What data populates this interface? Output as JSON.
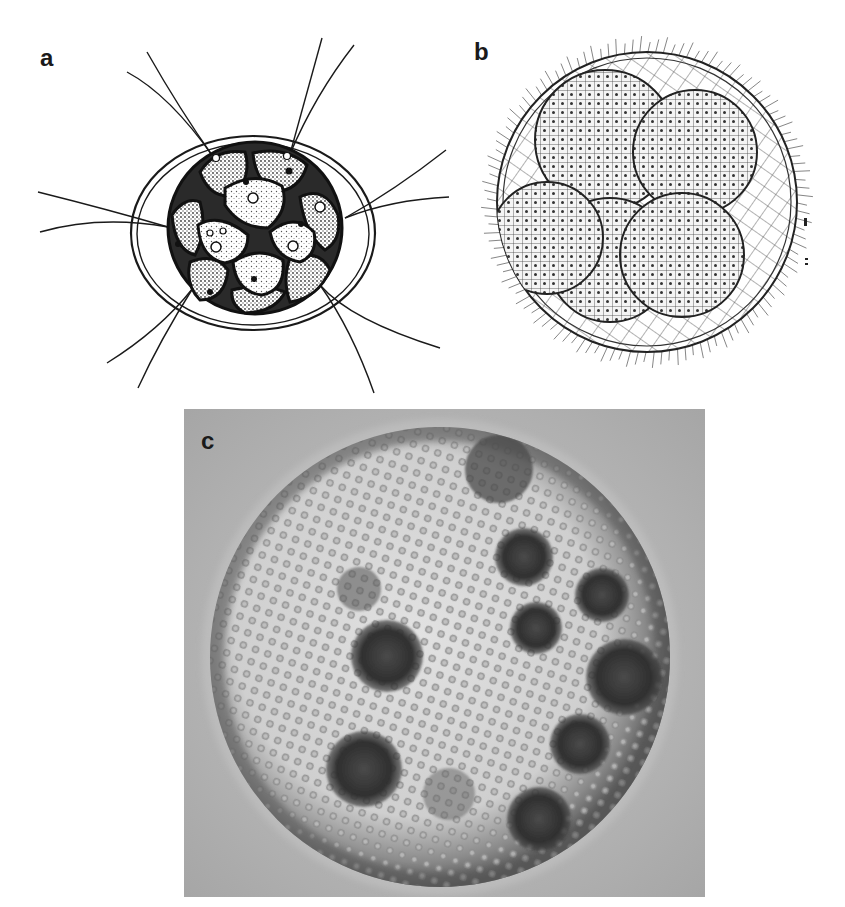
{
  "figure": {
    "panels": [
      {
        "id": "a",
        "label": "a",
        "kind": "line-drawing",
        "subject": "small colonial green alga: 16-cell colony inside an elliptical gelatinous envelope with paired flagella",
        "cell_count": 16,
        "flagella_pairs": 6
      },
      {
        "id": "b",
        "label": "b",
        "kind": "line-drawing",
        "subject": "large spherical colony with reticulate surface network, peripheral cilia/flagella and five internal daughter colonies",
        "daughter_colony_count": 5
      },
      {
        "id": "c",
        "label": "c",
        "kind": "light-micrograph",
        "subject": "spherical colony with regularly spaced surface cells and dark internal daughter colonies",
        "daughter_colony_count": 9
      }
    ]
  },
  "colors": {
    "background": "#ffffff",
    "ink": "#1a1a1a",
    "micrograph_bg": "#b4b4b4",
    "micrograph_sphere": "#d8d8d8",
    "micrograph_dark": "#2e2e2e"
  }
}
